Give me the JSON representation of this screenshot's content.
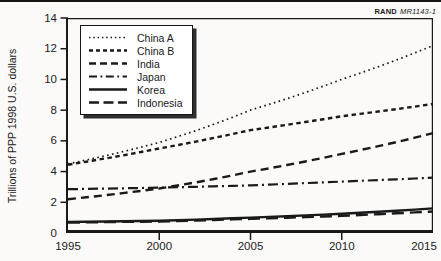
{
  "source_label": {
    "brand": "RAND",
    "doc": "MR1143-1"
  },
  "chart_data": {
    "type": "line",
    "title": "",
    "ylabel": "Trillions of PPP 1998 U.S. dollars",
    "xlabel": "",
    "x": [
      1995,
      2000,
      2005,
      2010,
      2015
    ],
    "xlim": [
      1995,
      2015
    ],
    "ylim": [
      0,
      14
    ],
    "xticks": [
      1995,
      2000,
      2005,
      2010,
      2015
    ],
    "yticks": [
      0,
      2,
      4,
      6,
      8,
      10,
      12,
      14
    ],
    "grid": false,
    "legend_position": "top-left",
    "line_color": "#1a1a1a",
    "series": [
      {
        "name": "China A",
        "style": "dotted",
        "values": [
          4.5,
          5.9,
          8.0,
          10.0,
          12.2
        ]
      },
      {
        "name": "China B",
        "style": "dashed-short",
        "values": [
          4.45,
          5.5,
          6.7,
          7.6,
          8.4
        ]
      },
      {
        "name": "India",
        "style": "dashed-medium",
        "values": [
          2.2,
          2.9,
          4.0,
          5.15,
          6.5
        ]
      },
      {
        "name": "Japan",
        "style": "dash-dot",
        "values": [
          2.85,
          2.95,
          3.1,
          3.35,
          3.6
        ]
      },
      {
        "name": "Korea",
        "style": "solid",
        "values": [
          0.72,
          0.8,
          1.0,
          1.25,
          1.6
        ]
      },
      {
        "name": "Indonesia",
        "style": "dashed-long",
        "values": [
          0.68,
          0.75,
          0.92,
          1.12,
          1.4
        ]
      }
    ]
  }
}
